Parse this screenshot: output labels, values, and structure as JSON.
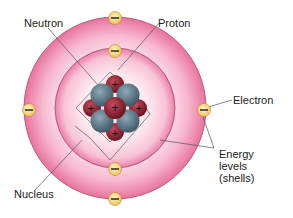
{
  "labels": {
    "neutron": "Neutron",
    "proton": "Proton",
    "electron": "Electron",
    "energy_levels_line1": "Energy",
    "energy_levels_line2": "levels",
    "energy_levels_line3": "(shells)",
    "nucleus": "Nucleus"
  },
  "symbols": {
    "electron": "−",
    "proton": "+"
  },
  "colors": {
    "outer_shell": "#e8739c",
    "inner_shell": "#f2a3c1",
    "electron_fill": "#f6d27a",
    "proton": "#8e1c2c",
    "neutron": "#5b7a8e"
  },
  "electron_count": 6,
  "shell_count": 2
}
